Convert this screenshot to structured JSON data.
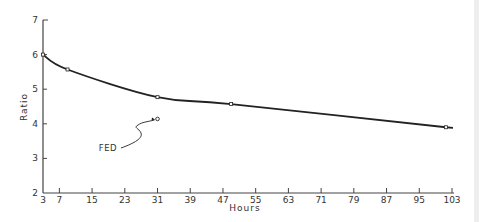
{
  "chart_data": {
    "type": "line",
    "title": "",
    "xlabel": "Hours",
    "ylabel": "Ratio",
    "xlim": [
      3,
      103
    ],
    "ylim": [
      2,
      7
    ],
    "x_ticks": [
      3,
      7,
      15,
      23,
      31,
      39,
      47,
      55,
      63,
      71,
      79,
      87,
      95,
      103
    ],
    "y_ticks": [
      2,
      3,
      4,
      5,
      6,
      7
    ],
    "grid": false,
    "legend": null,
    "series": [
      {
        "name": "Ratio",
        "x": [
          3,
          9,
          31,
          49,
          101.5
        ],
        "values": [
          6.0,
          5.57,
          4.77,
          4.57,
          3.9
        ],
        "style": "solid line with small square markers"
      },
      {
        "name": "FED",
        "x": [
          31
        ],
        "values": [
          4.14
        ],
        "style": "open circle marker"
      }
    ],
    "annotations": [
      {
        "text": "FED",
        "points_to": {
          "x": 31,
          "y": 4.14
        },
        "arrow": "wavy"
      }
    ]
  },
  "colors": {
    "line": "#222222",
    "axis": "#444444",
    "text": "#333333",
    "background": "#ffffff"
  }
}
